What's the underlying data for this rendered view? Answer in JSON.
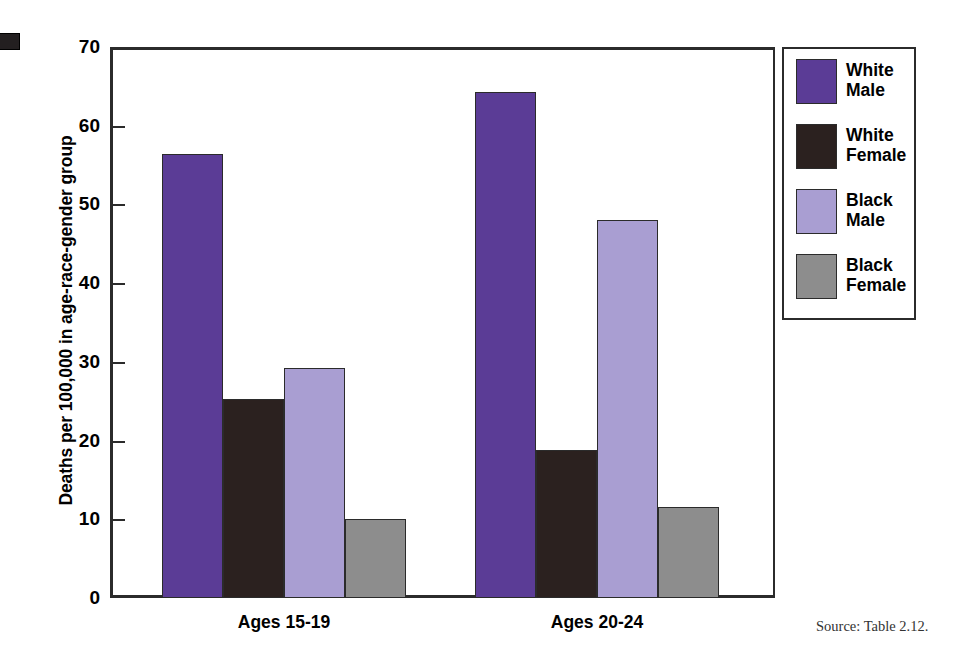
{
  "figure": {
    "y_axis_title": "Deaths per 100,000 in age-race-gender group",
    "source_note": "Source:  Table 2.12.",
    "corner_mark_name": "page-corner-mark"
  },
  "legend": {
    "items": [
      {
        "label_line1": "White",
        "label_line2": "Male",
        "color": "#5b3c96",
        "key": "white-male"
      },
      {
        "label_line1": "White",
        "label_line2": "Female",
        "color": "#2b211f",
        "key": "white-female"
      },
      {
        "label_line1": "Black",
        "label_line2": "Male",
        "color": "#a99ed2",
        "key": "black-male"
      },
      {
        "label_line1": "Black",
        "label_line2": "Female",
        "color": "#8d8d8d",
        "key": "black-female"
      }
    ]
  },
  "chart_data": {
    "type": "bar",
    "title": "",
    "xlabel": "",
    "ylabel": "Deaths per 100,000 in age-race-gender group",
    "ylim": [
      0,
      70
    ],
    "yticks": [
      0,
      10,
      20,
      30,
      40,
      50,
      60,
      70
    ],
    "ytick_labels": [
      "0",
      "10",
      "20",
      "30",
      "40",
      "50",
      "60",
      "70"
    ],
    "grid": false,
    "legend_position": "right",
    "categories": [
      "Ages 15-19",
      "Ages 20-24"
    ],
    "series": [
      {
        "name": "White Male",
        "color": "#5b3c96",
        "values": [
          56.4,
          64.3
        ]
      },
      {
        "name": "White Female",
        "color": "#2b211f",
        "values": [
          25.3,
          18.8
        ]
      },
      {
        "name": "Black Male",
        "color": "#a99ed2",
        "values": [
          29.2,
          48.0
        ]
      },
      {
        "name": "Black Female",
        "color": "#8d8d8d",
        "values": [
          10.0,
          11.5
        ]
      }
    ]
  }
}
